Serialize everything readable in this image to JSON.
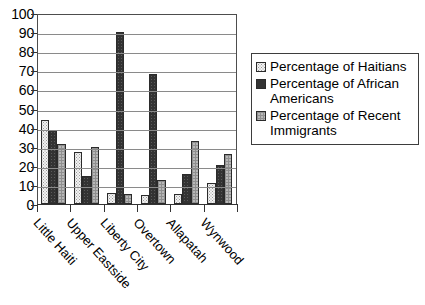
{
  "chart_data": {
    "type": "bar",
    "title": "",
    "subtitle": "",
    "xlabel": "",
    "ylabel": "",
    "ylim": [
      0,
      100
    ],
    "yticks": [
      0,
      10,
      20,
      30,
      40,
      50,
      60,
      70,
      80,
      90,
      100
    ],
    "grid": true,
    "legend_position": "right",
    "categories": [
      "Little Haiti",
      "Upper Eastside",
      "Liberty City",
      "Overtown",
      "Allapatah",
      "Wynwood"
    ],
    "series": [
      {
        "name": "Percentage of Haitians",
        "pattern": "light-dotted",
        "color": "#f2f2f2",
        "values": [
          44,
          27,
          6,
          4.5,
          5,
          11
        ]
      },
      {
        "name": "Percentage of African Americans",
        "pattern": "solid-dark",
        "color": "#333333",
        "values": [
          38.5,
          14.5,
          90,
          68,
          15.5,
          20.5
        ]
      },
      {
        "name": "Percentage of Recent Immigrants",
        "pattern": "gray-crosshatch",
        "color": "#b8b8b8",
        "values": [
          31.5,
          30,
          5.5,
          12.5,
          33,
          26
        ]
      }
    ]
  },
  "legend": {
    "entries": [
      "Percentage of Haitians",
      "Percentage of African Americans",
      "Percentage of Recent Immigrants"
    ]
  }
}
